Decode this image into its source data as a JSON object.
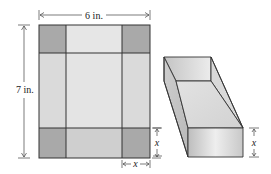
{
  "figure": {
    "sheet": {
      "width_label": "6 in.",
      "height_label": "7 in.",
      "corner_cut_label": "x",
      "corner_cut_vertical_label": "x"
    },
    "box": {
      "height_label": "x"
    },
    "colors": {
      "corner": "#a9a9a9",
      "flap": "#d4d4d4",
      "base": "#e0e0e0",
      "outline": "#333333"
    }
  }
}
